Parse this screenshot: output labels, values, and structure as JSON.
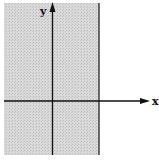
{
  "diagram": {
    "type": "coordinate-plane-shaded-region",
    "axes": {
      "x_label": "x",
      "y_label": "y"
    },
    "shaded_region": {
      "description": "Half-plane to the left of a vertical boundary line (x < a, a > 0)",
      "fill_color": "#d4d4d4",
      "boundary": "vertical solid line right of y-axis"
    },
    "colors": {
      "axis": "#111111",
      "boundary_line": "#222222",
      "shade": "#d4d4d4",
      "background": "#ffffff"
    }
  }
}
